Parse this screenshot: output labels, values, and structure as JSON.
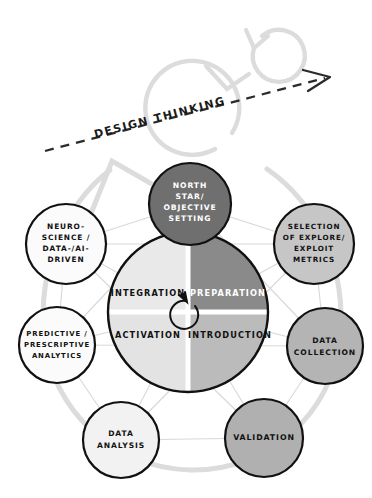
{
  "diagram": {
    "title_arrow": {
      "label": "DESIGN THINKING",
      "name": "design-thinking-arrow",
      "direction": "up-right",
      "style": "dashed",
      "color": "#2b2b2b"
    },
    "center_wheel": {
      "name": "center-wheel",
      "outline_color": "#111111",
      "center_arrow": "circular-loop-arrow",
      "quadrants": [
        {
          "id": "integration",
          "label": "INTEGRATION",
          "position": "top-left",
          "fill": "#e9e9e9",
          "text_color": "#111111"
        },
        {
          "id": "preparation",
          "label": "PREPARATION",
          "position": "top-right",
          "fill": "#8a8a8a",
          "text_color": "#ffffff"
        },
        {
          "id": "activation",
          "label": "ACTIVATION",
          "position": "bottom-left",
          "fill": "#e3e3e3",
          "text_color": "#111111"
        },
        {
          "id": "introduction",
          "label": "INTRODUCTION",
          "position": "bottom-right",
          "fill": "#bbbbbb",
          "text_color": "#111111"
        }
      ]
    },
    "outer_nodes": [
      {
        "id": "north-star",
        "lines": [
          "NORTH",
          "STAR/",
          "OBJECTIVE",
          "SETTING"
        ],
        "fill": "#6f6f6f",
        "text_color": "#ffffff",
        "cx": 190,
        "cy": 204,
        "r": 41
      },
      {
        "id": "explore-exploit-metrics",
        "lines": [
          "SELECTION",
          "OF EXPLORE/",
          "EXPLOIT",
          "METRICS"
        ],
        "fill": "#c6c6c6",
        "text_color": "#111111",
        "cx": 314,
        "cy": 244,
        "r": 40
      },
      {
        "id": "data-collection",
        "lines": [
          "DATA",
          "COLLECTION"
        ],
        "fill": "#b4b4b4",
        "text_color": "#111111",
        "cx": 325,
        "cy": 346,
        "r": 38
      },
      {
        "id": "validation",
        "lines": [
          "VALIDATION"
        ],
        "fill": "#b0b0b0",
        "text_color": "#111111",
        "cx": 264,
        "cy": 438,
        "r": 39
      },
      {
        "id": "data-analysis",
        "lines": [
          "DATA",
          "ANALYSIS"
        ],
        "fill": "#f2f2f2",
        "text_color": "#111111",
        "cx": 121,
        "cy": 440,
        "r": 38
      },
      {
        "id": "predictive-prescriptive-analytics",
        "lines": [
          "PREDICTIVE /",
          "PRESCRIPTIVE",
          "ANALYTICS"
        ],
        "fill": "#fbfbfb",
        "text_color": "#111111",
        "cx": 57,
        "cy": 345,
        "r": 38
      },
      {
        "id": "neuroscience-data-ai-driven",
        "lines": [
          "NEURO-",
          "SCIENCE /",
          "DATA-/AI-",
          "DRIVEN"
        ],
        "fill": "#fbfbfb",
        "text_color": "#111111",
        "cx": 66,
        "cy": 244,
        "r": 40
      }
    ],
    "background_spirals": {
      "name": "background-loop-arrows",
      "color": "#dcdcdc",
      "count": 3
    },
    "network_lines": {
      "name": "node-connection-lines",
      "color": "#d8d8d8"
    }
  }
}
